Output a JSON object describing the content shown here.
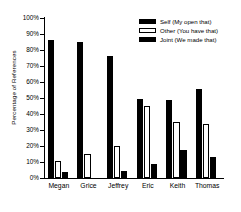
{
  "chart_data": {
    "type": "bar",
    "title": "",
    "xlabel": "",
    "ylabel": "Percentage of References",
    "ylim": [
      0,
      100
    ],
    "ytick_labels": [
      "100%",
      "90%",
      "80%",
      "70%",
      "60%",
      "50%",
      "40%",
      "30%",
      "20%",
      "10%",
      "0%"
    ],
    "ytick_values": [
      100,
      90,
      80,
      70,
      60,
      50,
      40,
      30,
      20,
      10,
      0
    ],
    "grid": false,
    "legend_position": "top-right",
    "categories": [
      "Megan",
      "Grice",
      "Jeffrey",
      "Eric",
      "Keith",
      "Thomas"
    ],
    "series": [
      {
        "name": "Self  (My open that)",
        "short_name": "Self",
        "color": "#000000",
        "style": "filled",
        "values": [
          86,
          85,
          76.5,
          49.5,
          48.5,
          55.5
        ]
      },
      {
        "name": "Other (You have that)",
        "short_name": "Other",
        "color": "#ffffff",
        "style": "hollow",
        "values": [
          10.5,
          15,
          20,
          45,
          35,
          34
        ]
      },
      {
        "name": "Joint (We made that)",
        "short_name": "Joint",
        "color": "#000000",
        "style": "filled",
        "values": [
          4,
          0,
          4.5,
          8.5,
          17.5,
          13
        ]
      }
    ]
  }
}
